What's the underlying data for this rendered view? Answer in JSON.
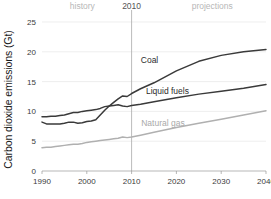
{
  "chart_data": {
    "type": "line",
    "title": "",
    "xlabel": "",
    "ylabel": "Carbon dioxide emissions (Gt)",
    "xlim": [
      1990,
      2040
    ],
    "ylim": [
      0,
      25
    ],
    "xticks": [
      "1990",
      "2000",
      "2010",
      "2020",
      "2030",
      "2040"
    ],
    "yticks": [
      "0",
      "5",
      "10",
      "15",
      "20",
      "25"
    ],
    "grid": true,
    "legend_position": "inline-annotations",
    "annotations": [
      {
        "name": "history",
        "text": "history",
        "x": 1999,
        "align": "center"
      },
      {
        "name": "divider-year",
        "text": "2010",
        "x": 2010,
        "align": "center"
      },
      {
        "name": "projections",
        "text": "projections",
        "x": 2028,
        "align": "center"
      }
    ],
    "divider_x": 2010,
    "x": [
      1990,
      1991,
      1992,
      1993,
      1994,
      1995,
      1996,
      1997,
      1998,
      1999,
      2000,
      2001,
      2002,
      2003,
      2004,
      2005,
      2006,
      2007,
      2008,
      2009,
      2010,
      2012,
      2015,
      2020,
      2025,
      2030,
      2035,
      2040
    ],
    "series": [
      {
        "name": "Coal",
        "label": "Coal",
        "color": "#3a3a3a",
        "label_x": 2014,
        "label_y": 18.2,
        "values": [
          8.2,
          7.9,
          7.9,
          7.9,
          7.9,
          8.0,
          8.2,
          8.2,
          8.0,
          8.1,
          8.3,
          8.4,
          8.6,
          9.4,
          10.2,
          10.9,
          11.5,
          12.1,
          12.6,
          12.5,
          13.0,
          13.8,
          14.8,
          16.8,
          18.4,
          19.4,
          20.0,
          20.4
        ]
      },
      {
        "name": "Liquid fuels",
        "label": "Liquid fuels",
        "color": "#3a3a3a",
        "label_x": 2018,
        "label_y": 12.9,
        "values": [
          9.1,
          9.1,
          9.2,
          9.2,
          9.3,
          9.4,
          9.6,
          9.8,
          9.8,
          10.0,
          10.1,
          10.2,
          10.3,
          10.5,
          10.8,
          10.9,
          11.0,
          11.1,
          10.9,
          10.8,
          11.0,
          11.2,
          11.6,
          12.3,
          12.9,
          13.4,
          13.9,
          14.5
        ]
      },
      {
        "name": "Natural gas",
        "label": "Natural gas",
        "color": "#b0b0b0",
        "label_x": 2017,
        "label_y": 7.6,
        "values": [
          3.9,
          4.0,
          4.0,
          4.1,
          4.2,
          4.3,
          4.4,
          4.5,
          4.5,
          4.6,
          4.8,
          4.9,
          5.0,
          5.1,
          5.2,
          5.3,
          5.4,
          5.5,
          5.7,
          5.6,
          5.7,
          6.0,
          6.5,
          7.3,
          8.0,
          8.7,
          9.4,
          10.1
        ]
      }
    ]
  }
}
